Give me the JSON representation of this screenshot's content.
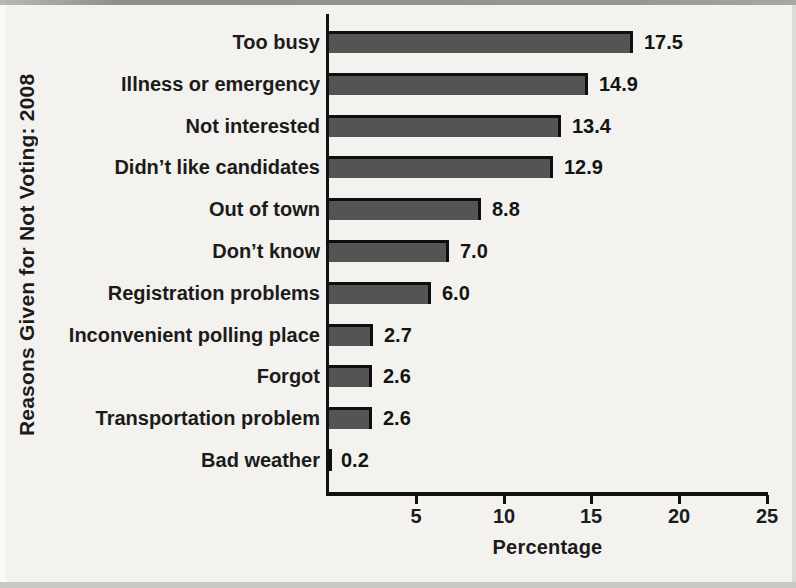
{
  "chart_data": {
    "type": "bar",
    "orientation": "horizontal",
    "title": "",
    "ylabel": "Reasons Given for Not Voting: 2008",
    "xlabel": "Percentage",
    "categories": [
      "Too busy",
      "Illness or emergency",
      "Not interested",
      "Didn’t like candidates",
      "Out of town",
      "Don’t know",
      "Registration problems",
      "Inconvenient polling place",
      "Forgot",
      "Transportation problem",
      "Bad weather"
    ],
    "values": [
      17.5,
      14.9,
      13.4,
      12.9,
      8.8,
      7.0,
      6.0,
      2.7,
      2.6,
      2.6,
      0.2
    ],
    "value_labels": [
      "17.5",
      "14.9",
      "13.4",
      "12.9",
      "8.8",
      "7.0",
      "6.0",
      "2.7",
      "2.6",
      "2.6",
      "0.2"
    ],
    "xlim": [
      0,
      25
    ],
    "x_ticks": [
      "5",
      "10",
      "15",
      "20",
      "25"
    ],
    "grid": false,
    "legend": "none",
    "bar_color": "#545454",
    "bar_edge_color": "#0e0e0e",
    "text_color": "#1b1b1b"
  }
}
